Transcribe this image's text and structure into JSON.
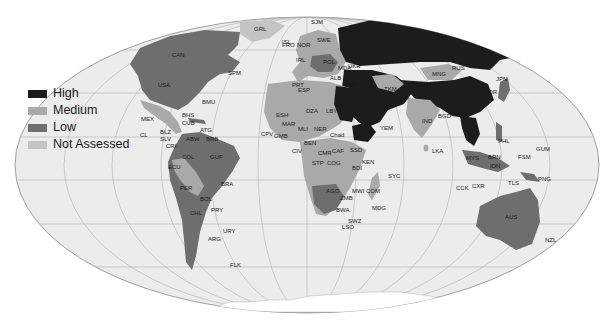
{
  "legend": {
    "items": [
      {
        "label": "High",
        "color": "#1c1c1c"
      },
      {
        "label": "Medium",
        "color": "#a9a9a9"
      },
      {
        "label": "Low",
        "color": "#6e6e6e"
      },
      {
        "label": "Not Assessed",
        "color": "#c4c4c4"
      }
    ]
  },
  "map": {
    "ocean_color": "#ececec",
    "graticule_color": "#9a9a9a",
    "labels": {
      "grl": "GRL",
      "isl": "ISL",
      "sjm": "SJM",
      "can": "CAN",
      "usa": "USA",
      "spm": "SPM",
      "bmu": "BMU",
      "mex": "MEX",
      "bhs": "BHS",
      "cub": "CUB",
      "cl": "CL",
      "blz": "BLZ",
      "slv": "SLV",
      "atg": "ATG",
      "abw": "ABW",
      "brb": "BRB",
      "cri": "CRI",
      "col": "COL",
      "guf": "GUF",
      "ecu": "ECU",
      "per": "PER",
      "bra": "BRA",
      "bol": "BOL",
      "chl": "CHL",
      "pry": "PRY",
      "ury": "URY",
      "arg": "ARG",
      "flk": "FLK",
      "rus": "RUS",
      "mng": "MNG",
      "chn": "CHN",
      "jpn": "JPN",
      "kor": "KOR",
      "ind": "IND",
      "bgd": "BGD",
      "lka": "LKA",
      "afg": "AFG",
      "tkm": "TKM",
      "yem": "YEM",
      "esh": "ESH",
      "mar": "MAR",
      "dza": "DZA",
      "lby": "LBY",
      "mli": "MLI",
      "ner": "NER",
      "tcd": "Chad",
      "cpv": "CPV",
      "gmb": "GMB",
      "ben": "BEN",
      "civ": "CIV",
      "cmr": "CMR",
      "caf": "CAF",
      "ssd": "SSD",
      "stp": "STP",
      "cog": "COG",
      "ken": "KEN",
      "bdi": "BDI",
      "syc": "SYC",
      "ago": "AGO",
      "mwi": "MWI",
      "com": "COM",
      "zmb": "ZMB",
      "mdg": "MDG",
      "bwa": "BWA",
      "swz": "SWZ",
      "lso": "LSO",
      "mys": "MYS",
      "brn": "BRN",
      "idn": "IDN",
      "fsm": "FSM",
      "gum": "GUM",
      "phl": "PHL",
      "png": "PNG",
      "tls": "TLS",
      "cck": "CCK",
      "cxr": "CXR",
      "aus": "AUS",
      "nzl": "NZL",
      "fro": "FRO",
      "nor": "NOR",
      "swe": "SWE",
      "pol": "POL",
      "mda": "MDA",
      "alb": "ALB",
      "prt": "PRT",
      "esp": "ESP",
      "irl": "IRL",
      "ukr": "UKR",
      "cyp": "CYP"
    }
  }
}
